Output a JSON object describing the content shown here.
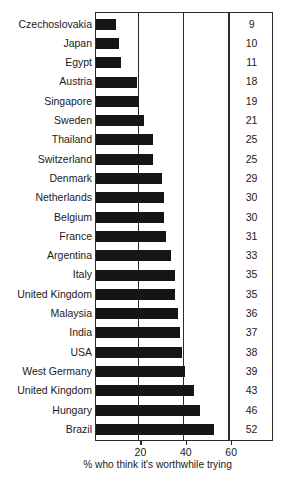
{
  "chart_data": {
    "type": "bar",
    "orientation": "horizontal",
    "title": "",
    "subtitle": "",
    "xlabel": "% who think it's worthwhile trying",
    "ylabel": "",
    "xlim": [
      0,
      60
    ],
    "grid": true,
    "legend": null,
    "xticks": [
      20,
      40,
      60
    ],
    "xtick_labels": [
      "20",
      "40",
      "60"
    ],
    "value_column_header": "",
    "categories": [
      "Czechoslovakia",
      "Japan",
      "Egypt",
      "Austria",
      "Singapore",
      "Sweden",
      "Thailand",
      "Switzerland",
      "Denmark",
      "Netherlands",
      "Belgium",
      "France",
      "Argentina",
      "Italy",
      "United Kingdom",
      "Malaysia",
      "India",
      "USA",
      "West Germany",
      "United Kingdom",
      "Hungary",
      "Brazil"
    ],
    "values": [
      9,
      10,
      11,
      18,
      19,
      21,
      25,
      25,
      29,
      30,
      30,
      31,
      33,
      35,
      35,
      36,
      37,
      38,
      39,
      43,
      46,
      52
    ],
    "value_labels": [
      "9",
      "10",
      "11",
      "18",
      "19",
      "21",
      "25",
      "25",
      "29",
      "30",
      "30",
      "31",
      "33",
      "35",
      "35",
      "36",
      "37",
      "38",
      "39",
      "43",
      "46",
      "52"
    ],
    "bar_color": "#151515",
    "frame_color": "#2b2b2b",
    "background_color": "#ffffff"
  }
}
